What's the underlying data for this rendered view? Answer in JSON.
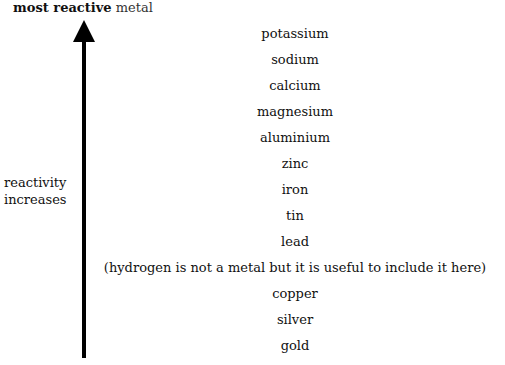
{
  "title": {
    "bold": "most reactive",
    "rest": " metal"
  },
  "side_label": {
    "line1": "reactivity",
    "line2": "increases"
  },
  "arrow": {
    "direction": "up",
    "color": "#000000"
  },
  "series": [
    "potassium",
    "sodium",
    "calcium",
    "magnesium",
    "aluminium",
    "zinc",
    "iron",
    "tin",
    "lead",
    "(hydrogen is not a metal but it is useful to include it here)",
    "copper",
    "silver",
    "gold"
  ]
}
